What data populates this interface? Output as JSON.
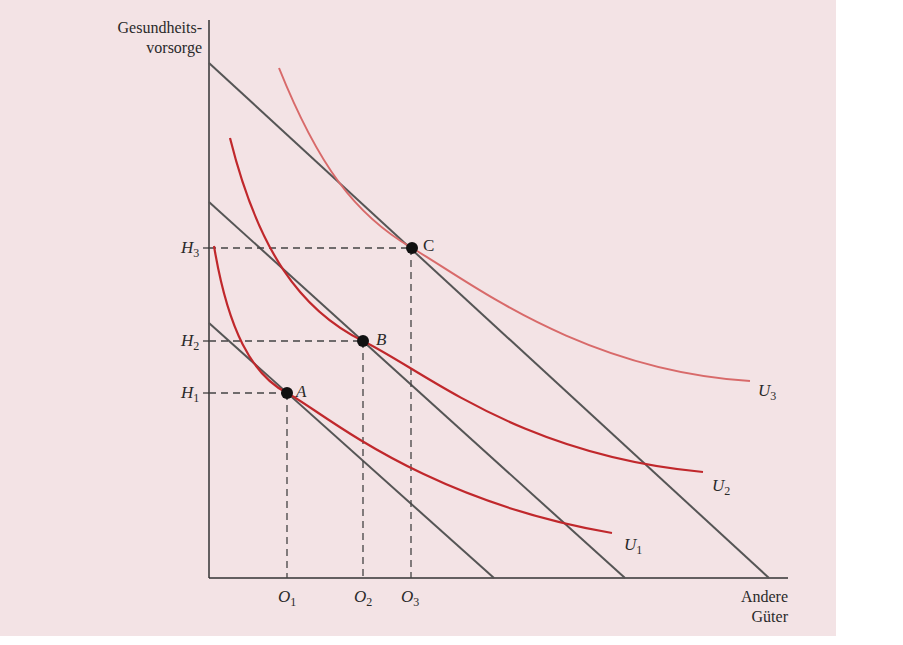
{
  "diagram": {
    "y_axis_title_line1": "Gesundheits-",
    "y_axis_title_line2": "vorsorge",
    "x_axis_title_line1": "Andere",
    "x_axis_title_line2": "Güter",
    "y_ticks": [
      {
        "base": "H",
        "sub": "3"
      },
      {
        "base": "H",
        "sub": "2"
      },
      {
        "base": "H",
        "sub": "1"
      }
    ],
    "x_ticks": [
      {
        "base": "O",
        "sub": "1"
      },
      {
        "base": "O",
        "sub": "2"
      },
      {
        "base": "O",
        "sub": "3"
      }
    ],
    "points": [
      {
        "label": "A"
      },
      {
        "label": "B"
      },
      {
        "label": "C"
      }
    ],
    "curves": [
      {
        "base": "U",
        "sub": "1"
      },
      {
        "base": "U",
        "sub": "2"
      },
      {
        "base": "U",
        "sub": "3"
      }
    ],
    "colors": {
      "background": "#f3e3e5",
      "budget_line": "#555555",
      "indifference_u1_u2": "#c0282c",
      "indifference_u3": "#d86a6a",
      "axis": "#333333"
    }
  }
}
